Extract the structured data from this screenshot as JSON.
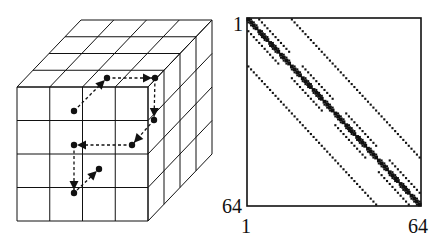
{
  "figure": {
    "left_panel": {
      "description": "4x4x4 cube grid with dashed path",
      "grid_size": 4,
      "path_points": [
        [
          74,
          111
        ],
        [
          107,
          78
        ],
        [
          155,
          78
        ],
        [
          154,
          120
        ],
        [
          132,
          145
        ],
        [
          74,
          145
        ],
        [
          74,
          193
        ],
        [
          99,
          169
        ]
      ],
      "line_color": "#111111"
    },
    "right_panel": {
      "description": "sparsity pattern of 64x64 matrix",
      "size": 64,
      "labels": {
        "top_left_row": "1",
        "bottom_left_row": "64",
        "bottom_left_col": "1",
        "bottom_right_col": "64"
      },
      "diagonal_offsets": [
        0,
        1,
        -1,
        4,
        -4,
        16,
        -16
      ],
      "block_sizes": {
        "offset_1": 4,
        "offset_4": 16,
        "offset_16": 64
      }
    }
  }
}
